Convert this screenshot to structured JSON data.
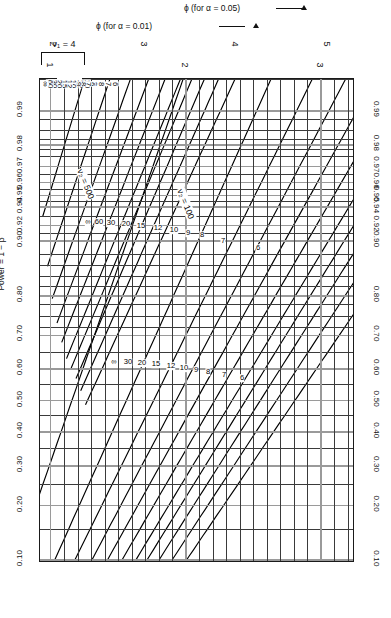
{
  "figure": {
    "kind": "pearson-hartley-power-chart",
    "nu1_label": "ν₁ = 4",
    "power_axis_title": "Power = 1 − β",
    "phi05_axis_title": "ϕ (for α = 0.05)",
    "phi01_axis_title": "ϕ (for α = 0.01)",
    "nu2_axis_label": "ν₂ = ∞",
    "annotation_100": "ν₂ = 100",
    "annotation_500": "ν₂ = 500",
    "ink_color": "#000000",
    "grid_color": "#3a3a3a",
    "grid_major_color": "#9a9a9a"
  },
  "chart_data": {
    "type": "line",
    "xlabel": "ϕ",
    "ylabel": "Power = 1 − β",
    "grid": true,
    "legend": "curve-end labels",
    "power_ticks": [
      "0.99",
      "0.98",
      "0.97",
      "0.96",
      "0.95",
      "0.94",
      "0.92",
      "0.90",
      "0.80",
      "0.70",
      "0.60",
      "0.50",
      "0.40",
      "0.30",
      "0.20",
      "0.10"
    ],
    "power_tick_values": [
      0.99,
      0.98,
      0.97,
      0.96,
      0.95,
      0.94,
      0.92,
      0.9,
      0.8,
      0.7,
      0.6,
      0.5,
      0.4,
      0.3,
      0.2,
      0.1
    ],
    "phi_alpha_01_ticks": [
      "1",
      "2",
      "3"
    ],
    "phi_alpha_05_ticks": [
      "2",
      "3",
      "4",
      "5"
    ],
    "nu2_levels": [
      "6",
      "7",
      "8",
      "9",
      "10",
      "12",
      "15",
      "20",
      "30",
      "60",
      "∞"
    ],
    "families": [
      {
        "name": "alpha = 0.01",
        "alpha": 0.01,
        "phi_ticks": [
          1,
          2,
          3
        ]
      },
      {
        "name": "alpha = 0.05",
        "alpha": 0.05,
        "phi_ticks": [
          2,
          3,
          4,
          5
        ]
      }
    ],
    "extra_annotations": [
      "ν₂ = 100",
      "ν₂ = 500"
    ]
  }
}
